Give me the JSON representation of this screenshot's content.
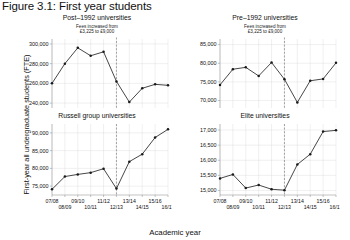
{
  "figure": {
    "title": "Figure 3.1: First year students",
    "ylabel": "First-year all undergraduate students (FTE)",
    "xlabel": "Academic year",
    "annotation_line1": "Fees increased from",
    "annotation_line2": "£3,225 to £9,000"
  },
  "chart_data": {
    "type": "line",
    "title": "Figure 3.1: First year students",
    "xlabel": "Academic year",
    "ylabel": "First-year all undergraduate students (FTE)",
    "grid": true,
    "legend": "none",
    "x": [
      "07/08",
      "08/09",
      "09/10",
      "10/11",
      "11/12",
      "12/13",
      "13/14",
      "14/15",
      "15/16",
      "16/17"
    ],
    "xtick_labels_top": [
      "07/08",
      "09/10",
      "11/12",
      "13/14",
      "15/16"
    ],
    "xtick_labels_bottom": [
      "08/09",
      "10/11",
      "12/13",
      "14/15",
      "16/17"
    ],
    "annotation": {
      "text": "Fees increased from £3,225 to £9,000",
      "at_x": "12/13",
      "style": "dashed vertical line"
    },
    "panels": [
      {
        "name": "post-1992",
        "title": "Post–1992 universities",
        "ylim": [
          235000,
          305000
        ],
        "yticks": [
          240000,
          260000,
          280000,
          300000
        ],
        "ytick_labels": [
          "240,000",
          "260,000",
          "280,000",
          "300,000"
        ],
        "values": [
          260000,
          280000,
          296000,
          288000,
          292000,
          262000,
          241000,
          255000,
          259000,
          258000
        ]
      },
      {
        "name": "pre-1992",
        "title": "Pre–1992 universities",
        "ylim": [
          68000,
          86500
        ],
        "yticks": [
          70000,
          75000,
          80000,
          85000
        ],
        "ytick_labels": [
          "70,000",
          "75,000",
          "80,000",
          "85,000"
        ],
        "values": [
          74200,
          78400,
          78900,
          76600,
          80200,
          75700,
          69500,
          75300,
          75800,
          80100
        ]
      },
      {
        "name": "russell-group",
        "title": "Russell group universities",
        "ylim": [
          72500,
          92500
        ],
        "yticks": [
          75000,
          80000,
          85000,
          90000
        ],
        "ytick_labels": [
          "75,000",
          "80,000",
          "85,000",
          "90,000"
        ],
        "values": [
          74100,
          77700,
          78300,
          78800,
          79900,
          74300,
          81900,
          84000,
          88700,
          91000
        ]
      },
      {
        "name": "elite",
        "title": "Elite universities",
        "ylim": [
          14850,
          17200
        ],
        "yticks": [
          15000,
          15500,
          16000,
          16500,
          17000
        ],
        "ytick_labels": [
          "15,000",
          "15,500",
          "16,000",
          "16,500",
          "17,000"
        ],
        "values": [
          15400,
          15530,
          15080,
          15180,
          15040,
          15010,
          15860,
          16200,
          16950,
          16990
        ]
      }
    ]
  }
}
